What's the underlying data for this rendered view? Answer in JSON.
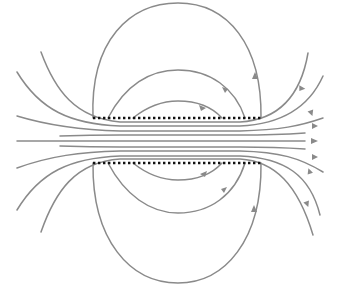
{
  "diagram": {
    "type": "field-lines",
    "colors": {
      "background": "#ffffff",
      "field_line": "#8a8a8a",
      "arrow": "#8a8a8a",
      "plate": "#111111"
    },
    "plates": [
      {
        "name": "top-plate",
        "y": 118,
        "x1": 93,
        "x2": 261,
        "style": "dotted"
      },
      {
        "name": "bottom-plate",
        "y": 163,
        "x1": 93,
        "x2": 261,
        "style": "dotted"
      }
    ],
    "loops": [
      {
        "name": "outer-loop",
        "top_y": 3,
        "bottom_y": 283
      },
      {
        "name": "middle-loop",
        "top_y": 70,
        "bottom_y": 213
      },
      {
        "name": "inner-loop",
        "top_y": 101,
        "bottom_y": 180
      }
    ],
    "through_lines_count": 9,
    "arrow_direction": "left-to-right through center; right-to-left around outside loops (up on right side above, down on right side below)"
  }
}
